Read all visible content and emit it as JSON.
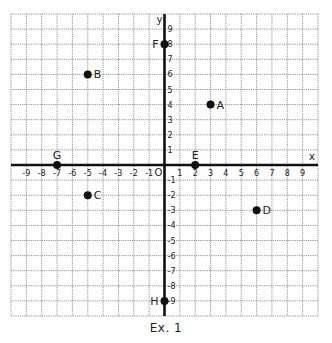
{
  "caption": "Ex. 1",
  "colors": {
    "grid": "#7a7a7a",
    "axis": "#111111",
    "point": "#111111",
    "text": "#222222"
  },
  "chart_data": {
    "type": "scatter",
    "title": "",
    "xlabel": "x",
    "ylabel": "y",
    "xlim": [
      -10,
      10
    ],
    "ylim": [
      -10,
      10
    ],
    "grid": true,
    "origin_label": "O",
    "x_ticks": [
      -9,
      -8,
      -7,
      -6,
      -5,
      -4,
      -3,
      -2,
      -1,
      1,
      2,
      3,
      4,
      5,
      6,
      7,
      8,
      9
    ],
    "y_ticks": [
      -9,
      -8,
      -7,
      -6,
      -5,
      -4,
      -3,
      -2,
      -1,
      1,
      2,
      3,
      4,
      5,
      6,
      7,
      8,
      9
    ],
    "points": [
      {
        "label": "A",
        "x": 3,
        "y": 4,
        "label_pos": "right"
      },
      {
        "label": "B",
        "x": -5,
        "y": 6,
        "label_pos": "right"
      },
      {
        "label": "C",
        "x": -5,
        "y": -2,
        "label_pos": "right"
      },
      {
        "label": "D",
        "x": 6,
        "y": -3,
        "label_pos": "right"
      },
      {
        "label": "E",
        "x": 2,
        "y": 0,
        "label_pos": "above"
      },
      {
        "label": "F",
        "x": 0,
        "y": 8,
        "label_pos": "left"
      },
      {
        "label": "G",
        "x": -7,
        "y": 0,
        "label_pos": "above"
      },
      {
        "label": "H",
        "x": 0,
        "y": -9,
        "label_pos": "left"
      }
    ]
  }
}
